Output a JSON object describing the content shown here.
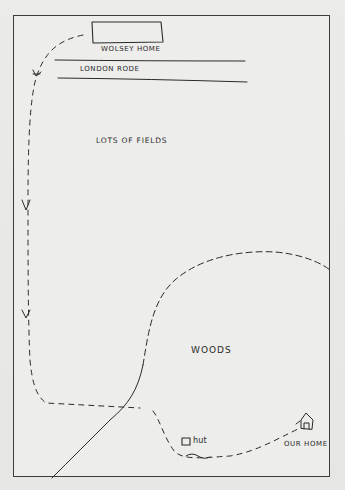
{
  "map": {
    "title": "Hand-drawn route map",
    "labels": {
      "wolsey_home": "Wolsey Home",
      "london_road": "London Rode",
      "lots_of_fields": "Lots of Fields",
      "woods": "Woods",
      "hut": "hut",
      "our_home": "Our Home"
    },
    "features": [
      {
        "name": "wolsey-home",
        "type": "building-rectangle"
      },
      {
        "name": "london-road",
        "type": "road-parallel-lines"
      },
      {
        "name": "lots-of-fields",
        "type": "area-label"
      },
      {
        "name": "woods",
        "type": "area-bounded-by-dashed-curve"
      },
      {
        "name": "hut",
        "type": "square-marker"
      },
      {
        "name": "our-home",
        "type": "house-icon"
      },
      {
        "name": "route",
        "type": "dashed-path-with-arrows"
      }
    ],
    "colors": {
      "ink": "#2a2a2a",
      "paper": "#ededeb",
      "frame": "#3c3c3c"
    }
  }
}
